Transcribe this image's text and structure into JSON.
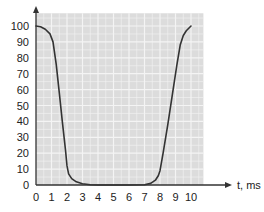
{
  "chart_data": {
    "type": "line",
    "title": "",
    "xlabel": "t, ms",
    "ylabel": "",
    "x_ticks": [
      "0",
      "1",
      "2",
      "3",
      "4",
      "5",
      "6",
      "7",
      "8",
      "9",
      "10"
    ],
    "y_ticks": [
      "0",
      "10",
      "20",
      "30",
      "40",
      "50",
      "60",
      "70",
      "80",
      "90",
      "100"
    ],
    "xlim": [
      0,
      10.8
    ],
    "ylim": [
      0,
      108
    ],
    "grid": true,
    "legend": null,
    "colors": {
      "background": "#dcdcdc",
      "grid": "#f4f4f4",
      "line": "#333333",
      "axis": "#333333"
    },
    "series": [
      {
        "name": "pulse",
        "x": [
          0,
          0.3,
          0.6,
          0.9,
          1.1,
          1.3,
          1.5,
          1.7,
          1.9,
          2.0,
          2.1,
          2.3,
          2.6,
          3.0,
          3.5,
          4.0,
          5.0,
          6.0,
          7.0,
          7.4,
          7.7,
          7.9,
          8.0,
          8.2,
          8.5,
          8.8,
          9.1,
          9.3,
          9.5,
          9.7,
          10.0
        ],
        "y": [
          100,
          99.5,
          98,
          95,
          90,
          76,
          58,
          40,
          22,
          12,
          7,
          4,
          2,
          0.8,
          0.2,
          0,
          0,
          0,
          0.2,
          1,
          3,
          6,
          9,
          20,
          38,
          57,
          76,
          88,
          94,
          97,
          100
        ]
      }
    ]
  }
}
